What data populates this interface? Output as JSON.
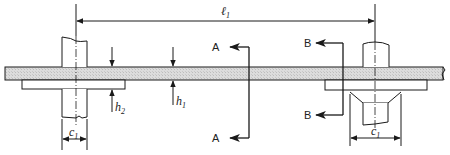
{
  "diagram": {
    "type": "technical-drawing",
    "colors": {
      "line": "#1a1a1a",
      "hatch": "#d6d6d6",
      "background": "#ffffff"
    },
    "dimensions": {
      "span": {
        "symbol": "ℓ",
        "subscript": "1"
      },
      "h1": {
        "symbol": "h",
        "subscript": "1"
      },
      "h2": {
        "symbol": "h",
        "subscript": "2"
      },
      "c1_left": {
        "symbol": "c",
        "subscript": "1"
      },
      "c1_right": {
        "symbol": "c",
        "subscript": "1"
      }
    },
    "sections": {
      "a_top": "A",
      "a_bottom": "A",
      "b_top": "B",
      "b_bottom": "B"
    }
  }
}
